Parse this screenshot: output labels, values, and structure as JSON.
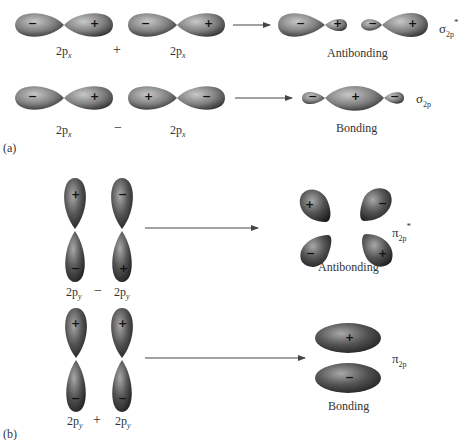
{
  "panel_a": {
    "label": "(a)",
    "row1": {
      "orbital_left": {
        "label": "2p",
        "subscript": "x",
        "signs": [
          "−",
          "+"
        ]
      },
      "operator": "+",
      "orbital_right": {
        "label": "2p",
        "subscript": "x",
        "signs": [
          "−",
          "+"
        ]
      },
      "result_signs": [
        "−",
        "+",
        "−",
        "+"
      ],
      "result_caption": "Antibonding",
      "mo_symbol": "σ",
      "mo_subscript": "2p",
      "mo_star": "*"
    },
    "row2": {
      "orbital_left": {
        "label": "2p",
        "subscript": "x",
        "signs": [
          "−",
          "+"
        ]
      },
      "operator": "−",
      "orbital_right": {
        "label": "2p",
        "subscript": "x",
        "signs": [
          "+",
          "−"
        ]
      },
      "result_signs": [
        "−",
        "+",
        "−"
      ],
      "result_caption": "Bonding",
      "mo_symbol": "σ",
      "mo_subscript": "2p"
    }
  },
  "panel_b": {
    "label": "(b)",
    "row1": {
      "orbital_left": {
        "label": "2p",
        "subscript": "y",
        "signs": [
          "+",
          "−"
        ]
      },
      "operator": "−",
      "orbital_right": {
        "label": "2p",
        "subscript": "y",
        "signs": [
          "−",
          "+"
        ]
      },
      "result_signs": [
        "+",
        "−",
        "−",
        "+"
      ],
      "result_caption": "Antibonding",
      "mo_symbol": "π",
      "mo_subscript": "2p",
      "mo_star": "*"
    },
    "row2": {
      "orbital_left": {
        "label": "2p",
        "subscript": "y",
        "signs": [
          "+",
          "−"
        ]
      },
      "operator": "+",
      "orbital_right": {
        "label": "2p",
        "subscript": "y",
        "signs": [
          "+",
          "−"
        ]
      },
      "result_signs": [
        "+",
        "−"
      ],
      "result_caption": "Bonding",
      "mo_symbol": "π",
      "mo_subscript": "2p"
    }
  },
  "colors": {
    "lobe_light": "#b5b5b5",
    "lobe_dark": "#2e2e2e",
    "arrow": "#444444",
    "background": "#ffffff"
  }
}
